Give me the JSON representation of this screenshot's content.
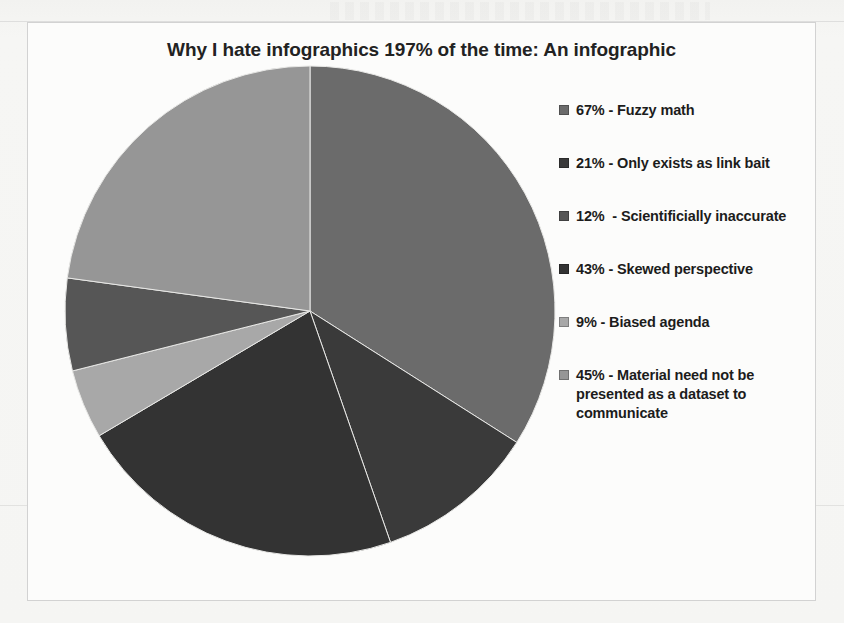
{
  "chart_data": {
    "type": "pie",
    "title": "Why I hate infographics 197% of the time: An infographic",
    "total": 197,
    "legend_position": "right",
    "grid": false,
    "categories": [
      "Fuzzy math",
      "Only exists as link bait",
      "Scientificially inaccurate",
      "Skewed perspective",
      "Biased agenda",
      "Material need not be presented as a dataset to communicate"
    ],
    "values": [
      67,
      21,
      12,
      43,
      9,
      45
    ],
    "labels": [
      "67% - Fuzzy math",
      "21% - Only exists as link bait",
      "12%  - Scientificially inaccurate",
      "43% - Skewed perspective",
      "9% - Biased agenda",
      "45% - Material need not be presented as a dataset to communicate"
    ],
    "colors": [
      "#6b6b6b",
      "#3a3a3a",
      "#565656",
      "#333333",
      "#a8a8a8",
      "#969696"
    ],
    "slice_order_clockwise_from_top": [
      {
        "label": "67% - Fuzzy math",
        "value": 67,
        "color": "#6b6b6b"
      },
      {
        "label": "21% - Only exists as link bait",
        "value": 21,
        "color": "#3a3a3a"
      },
      {
        "label": "43% - Skewed perspective",
        "value": 43,
        "color": "#333333"
      },
      {
        "label": "9% - Biased agenda",
        "value": 9,
        "color": "#a8a8a8"
      },
      {
        "label": "12%  - Scientificially inaccurate",
        "value": 12,
        "color": "#565656"
      },
      {
        "label": "45% - Material need not be presented as a dataset to communicate",
        "value": 45,
        "color": "#969696"
      }
    ]
  },
  "legend": {
    "items": [
      {
        "label": "67% - Fuzzy math",
        "color": "#6b6b6b"
      },
      {
        "label": "21% - Only exists as link bait",
        "color": "#3a3a3a"
      },
      {
        "label": "12%  - Scientificially inaccurate",
        "color": "#565656"
      },
      {
        "label": "43% - Skewed perspective",
        "color": "#333333"
      },
      {
        "label": "9% - Biased agenda",
        "color": "#a8a8a8"
      },
      {
        "label": "45% - Material need not be presented as a dataset to communicate",
        "color": "#969696"
      }
    ]
  }
}
